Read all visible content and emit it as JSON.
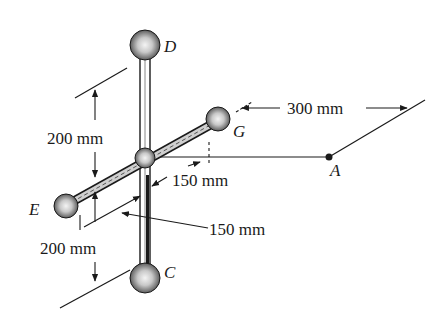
{
  "diagram": {
    "type": "mechanics-rigid-body",
    "points": [
      {
        "id": "D",
        "label": "D",
        "role": "top sphere"
      },
      {
        "id": "C",
        "label": "C",
        "role": "bottom sphere"
      },
      {
        "id": "E",
        "label": "E",
        "role": "left sphere"
      },
      {
        "id": "G",
        "label": "G",
        "role": "right sphere"
      },
      {
        "id": "A",
        "label": "A",
        "role": "reference point"
      }
    ],
    "dimensions": [
      {
        "id": "dim-top",
        "label": "200 mm",
        "between": "hub to D (vertical)"
      },
      {
        "id": "dim-bottom",
        "label": "200 mm",
        "between": "hub to C (vertical)"
      },
      {
        "id": "dim-hub-g",
        "label": "150 mm",
        "between": "hub to G (along rod)"
      },
      {
        "id": "dim-hub-e",
        "label": "150 mm",
        "between": "hub to E (along rod)"
      },
      {
        "id": "dim-a",
        "label": "300 mm",
        "between": "hub to A"
      }
    ],
    "colors": {
      "line": "#1a1a1a",
      "sphere_fill": "#bdbdbd",
      "background": "#ffffff"
    }
  }
}
